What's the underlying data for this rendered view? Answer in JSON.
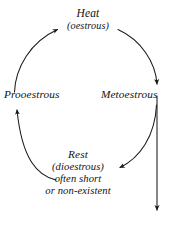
{
  "diagram": {
    "type": "cycle-diagram",
    "background_color": "#ffffff",
    "stroke_color": "#1a1a1a",
    "text_color": "#131313",
    "stages": [
      {
        "id": "heat",
        "position": "top",
        "lines": [
          "Heat",
          "(oestrous)"
        ]
      },
      {
        "id": "metoestrous",
        "position": "right",
        "lines": [
          "Metoestrous"
        ]
      },
      {
        "id": "rest",
        "position": "bottom",
        "lines": [
          "Rest",
          "(dioestrous)",
          "often short",
          "or non-existent"
        ]
      },
      {
        "id": "prooestrous",
        "position": "left",
        "lines": [
          "Prooestrous"
        ]
      }
    ],
    "arrows": [
      {
        "id": "heat-to-metoestrous",
        "from": "heat",
        "to": "metoestrous",
        "shape": "arc",
        "direction": "clockwise"
      },
      {
        "id": "metoestrous-to-rest",
        "from": "metoestrous",
        "to": "rest",
        "shape": "arc",
        "direction": "clockwise"
      },
      {
        "id": "rest-to-prooestrous",
        "from": "rest",
        "to": "prooestrous",
        "shape": "arc",
        "direction": "clockwise"
      },
      {
        "id": "prooestrous-to-heat",
        "from": "prooestrous",
        "to": "heat",
        "shape": "arc",
        "direction": "clockwise"
      },
      {
        "id": "metoestrous-exit",
        "from": "metoestrous",
        "to": "",
        "shape": "vertical-line",
        "direction": "downward"
      }
    ]
  }
}
